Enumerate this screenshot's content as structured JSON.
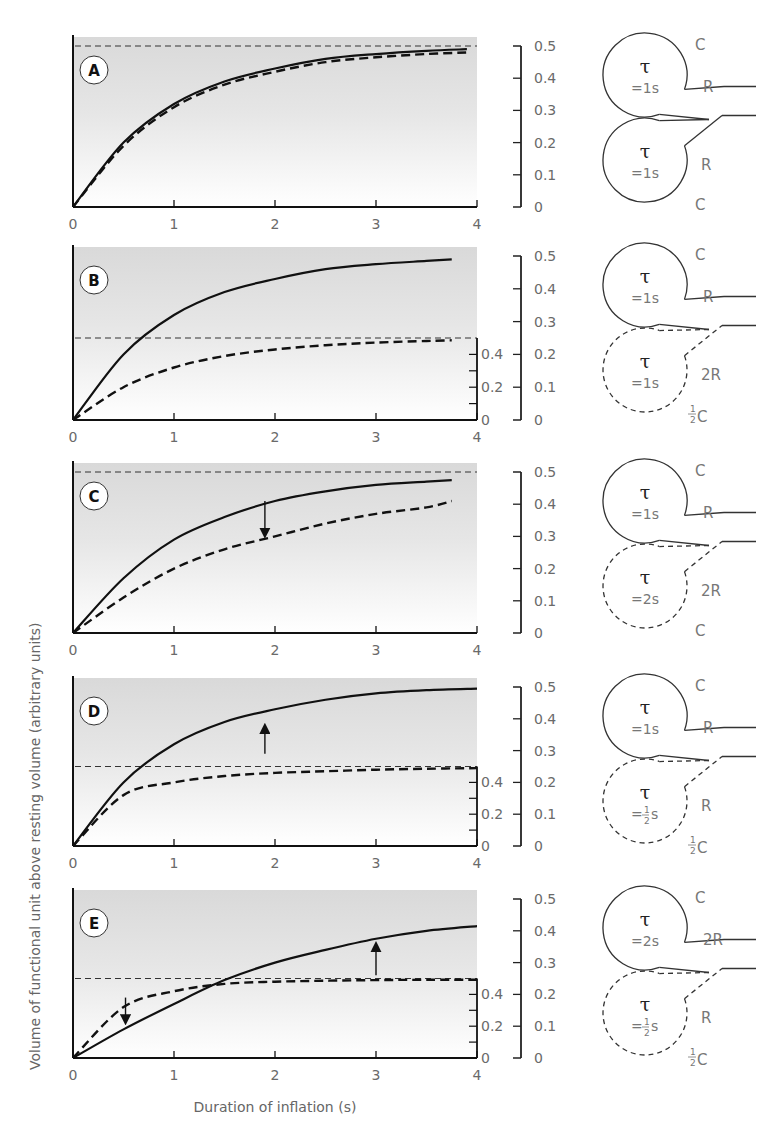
{
  "figure": {
    "ylabel": "Volume of functional unit above resting volume (arbitrary units)",
    "xlabel": "Duration of inflation (s)",
    "x_ticks": [
      "0",
      "1",
      "2",
      "3",
      "4"
    ],
    "outer_y_ticks": [
      "0",
      "0.1",
      "0.2",
      "0.3",
      "0.4",
      "0.5"
    ],
    "inner_y_ticks": [
      "0",
      "0.2",
      "0.4"
    ]
  },
  "panels": [
    {
      "letter": "A",
      "top_unit": {
        "tau": "τ",
        "tau_value": "=1s",
        "c_label": "C",
        "r_label": "R",
        "tau_frac": false,
        "c_frac": false
      },
      "bottom_unit": {
        "tau": "τ",
        "tau_value": "=1s",
        "c_label": "C",
        "r_label": "R",
        "tau_frac": false,
        "c_frac": false,
        "dashed": false
      }
    },
    {
      "letter": "B",
      "top_unit": {
        "tau": "τ",
        "tau_value": "=1s",
        "c_label": "C",
        "r_label": "R"
      },
      "bottom_unit": {
        "tau": "τ",
        "tau_value": "=1s",
        "c_label": "C",
        "c_prefix": "1/2",
        "r_label": "2R",
        "dashed": true
      }
    },
    {
      "letter": "C",
      "top_unit": {
        "tau": "τ",
        "tau_value": "=1s",
        "c_label": "C",
        "r_label": "R"
      },
      "bottom_unit": {
        "tau": "τ",
        "tau_value": "=2s",
        "c_label": "C",
        "r_label": "2R",
        "dashed": true
      }
    },
    {
      "letter": "D",
      "top_unit": {
        "tau": "τ",
        "tau_value": "=1s",
        "c_label": "C",
        "r_label": "R"
      },
      "bottom_unit": {
        "tau": "τ",
        "tau_value": "= 1/2 s",
        "c_label": "C",
        "c_prefix": "1/2",
        "r_label": "R",
        "dashed": true
      }
    },
    {
      "letter": "E",
      "top_unit": {
        "tau": "τ",
        "tau_value": "=2s",
        "c_label": "C",
        "r_label": "2R"
      },
      "bottom_unit": {
        "tau": "τ",
        "tau_value": "= 1/2 s",
        "c_label": "C",
        "c_prefix": "1/2",
        "r_label": "R",
        "dashed": true
      }
    }
  ],
  "chart_data": [
    {
      "type": "line",
      "title": "A",
      "xlabel": "Duration of inflation (s)",
      "ylabel": "Volume of functional unit above resting volume (arbitrary units)",
      "xlim": [
        0,
        4
      ],
      "ylim": [
        0,
        0.5
      ],
      "grid": false,
      "x": [
        0,
        0.5,
        1,
        1.5,
        2,
        2.5,
        3,
        3.5,
        3.9
      ],
      "series": [
        {
          "name": "solid (whole lung, τ=1s)",
          "style": "solid",
          "values": [
            0,
            0.2,
            0.32,
            0.39,
            0.43,
            0.46,
            0.475,
            0.485,
            0.49
          ]
        },
        {
          "name": "dashed (each unit, τ=1s)",
          "style": "dashed",
          "values": [
            0,
            0.19,
            0.31,
            0.38,
            0.42,
            0.45,
            0.465,
            0.475,
            0.48
          ]
        },
        {
          "name": "asymptote",
          "style": "dashed-thin",
          "values": [
            0.5,
            0.5,
            0.5,
            0.5,
            0.5,
            0.5,
            0.5,
            0.5,
            0.5
          ]
        }
      ]
    },
    {
      "type": "line",
      "title": "B",
      "xlim": [
        0,
        4
      ],
      "ylim": [
        0,
        0.5
      ],
      "inner_ylim": [
        0,
        0.5
      ],
      "x": [
        0,
        0.5,
        1,
        1.5,
        2,
        2.5,
        3,
        3.5,
        3.75
      ],
      "series": [
        {
          "name": "solid (τ=1s, C)",
          "style": "solid",
          "values": [
            0,
            0.2,
            0.32,
            0.39,
            0.43,
            0.46,
            0.475,
            0.485,
            0.49
          ]
        },
        {
          "name": "dashed (τ=1s, ½C)",
          "style": "dashed",
          "values": [
            0,
            0.1,
            0.16,
            0.195,
            0.215,
            0.228,
            0.236,
            0.241,
            0.243
          ]
        },
        {
          "name": "dashed asymptote (½ of 0.5)",
          "style": "dashed-thin",
          "values": [
            0.25,
            0.25,
            0.25,
            0.25,
            0.25,
            0.25,
            0.25,
            0.25,
            0.25
          ]
        }
      ]
    },
    {
      "type": "line",
      "title": "C",
      "xlim": [
        0,
        4
      ],
      "ylim": [
        0,
        0.5
      ],
      "x": [
        0,
        0.5,
        1,
        1.5,
        2,
        2.5,
        3,
        3.5,
        3.75
      ],
      "series": [
        {
          "name": "solid (τ=1s)",
          "style": "solid",
          "values": [
            0,
            0.17,
            0.29,
            0.36,
            0.41,
            0.44,
            0.46,
            0.47,
            0.475
          ]
        },
        {
          "name": "dashed (τ=2s)",
          "style": "dashed",
          "values": [
            0,
            0.11,
            0.2,
            0.26,
            0.3,
            0.34,
            0.37,
            0.39,
            0.41
          ]
        },
        {
          "name": "asymptote",
          "style": "dashed-thin",
          "values": [
            0.5,
            0.5,
            0.5,
            0.5,
            0.5,
            0.5,
            0.5,
            0.5,
            0.5
          ]
        }
      ],
      "annotations": [
        {
          "type": "arrow-down",
          "x": 1.9,
          "from": 0.41,
          "to": 0.31
        }
      ]
    },
    {
      "type": "line",
      "title": "D",
      "xlim": [
        0,
        4
      ],
      "ylim": [
        0,
        0.5
      ],
      "inner_ylim": [
        0,
        0.5
      ],
      "x": [
        0,
        0.5,
        1,
        1.5,
        2,
        2.5,
        3,
        3.5,
        4
      ],
      "series": [
        {
          "name": "solid (τ=1s)",
          "style": "solid",
          "values": [
            0,
            0.2,
            0.32,
            0.39,
            0.43,
            0.46,
            0.48,
            0.49,
            0.495
          ]
        },
        {
          "name": "dashed (τ=½s, ½C)",
          "style": "dashed",
          "values": [
            0,
            0.16,
            0.2,
            0.22,
            0.23,
            0.235,
            0.24,
            0.243,
            0.245
          ]
        },
        {
          "name": "dashed asymptote",
          "style": "dashed-thin",
          "values": [
            0.25,
            0.25,
            0.25,
            0.25,
            0.25,
            0.25,
            0.25,
            0.25,
            0.25
          ]
        }
      ],
      "annotations": [
        {
          "type": "arrow-up",
          "x": 1.9,
          "from": 0.29,
          "to": 0.37
        }
      ]
    },
    {
      "type": "line",
      "title": "E",
      "xlabel": "Duration of inflation (s)",
      "xlim": [
        0,
        4
      ],
      "ylim": [
        0,
        0.5
      ],
      "inner_ylim": [
        0,
        0.5
      ],
      "x": [
        0,
        0.5,
        1,
        1.5,
        2,
        2.5,
        3,
        3.5,
        4
      ],
      "series": [
        {
          "name": "solid (τ=2s)",
          "style": "solid",
          "values": [
            0,
            0.09,
            0.17,
            0.245,
            0.3,
            0.34,
            0.375,
            0.4,
            0.415
          ]
        },
        {
          "name": "dashed (τ=½s, ½C)",
          "style": "dashed",
          "values": [
            0,
            0.16,
            0.21,
            0.233,
            0.24,
            0.243,
            0.245,
            0.246,
            0.246
          ]
        },
        {
          "name": "dashed asymptote",
          "style": "dashed-thin",
          "values": [
            0.25,
            0.25,
            0.25,
            0.25,
            0.25,
            0.25,
            0.25,
            0.25,
            0.25
          ]
        }
      ],
      "annotations": [
        {
          "type": "arrow-down",
          "x": 0.52,
          "from": 0.19,
          "to": 0.12
        },
        {
          "type": "arrow-up",
          "x": 3.0,
          "from": 0.26,
          "to": 0.35
        }
      ]
    }
  ]
}
